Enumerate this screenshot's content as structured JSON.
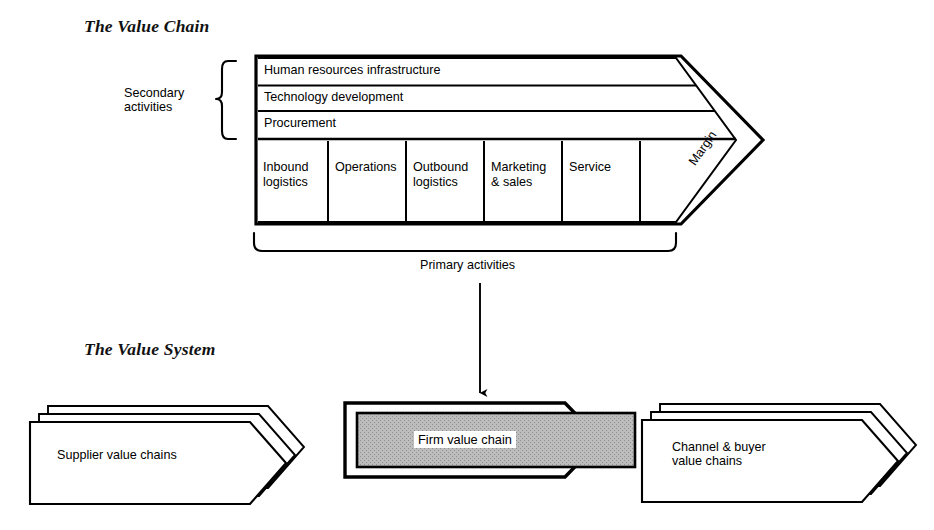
{
  "page": {
    "background_color": "#ffffff",
    "ink_color": "#000000",
    "gray_fill": "#b5b5b5"
  },
  "sections": {
    "value_chain": {
      "title": "The Value Chain",
      "secondary_activities_label": "Secondary\nactivities",
      "primary_activities_label": "Primary activities",
      "margin_label": "Margin",
      "support_rows": [
        {
          "id": "human-resources",
          "label": "Human resources infrastructure"
        },
        {
          "id": "technology-development",
          "label": "Technology development"
        },
        {
          "id": "procurement",
          "label": "Procurement"
        }
      ],
      "primary_activities": [
        {
          "id": "inbound-logistics",
          "label": "Inbound\nlogistics"
        },
        {
          "id": "operations",
          "label": "Operations"
        },
        {
          "id": "outbound-logistics",
          "label": "Outbound\nlogistics"
        },
        {
          "id": "marketing-sales",
          "label": "Marketing\n& sales"
        },
        {
          "id": "service",
          "label": "Service"
        }
      ]
    },
    "value_system": {
      "title": "The Value System",
      "nodes": [
        {
          "id": "supplier-value-chains",
          "label": "Supplier value chains",
          "stacked": true,
          "highlighted": false
        },
        {
          "id": "firm-value-chain",
          "label": "Firm value chain",
          "stacked": false,
          "highlighted": true
        },
        {
          "id": "channel-buyer-value-chains",
          "label": "Channel & buyer\nvalue chains",
          "stacked": true,
          "highlighted": false
        }
      ]
    }
  },
  "connector": {
    "id": "primary-to-firm-arrow",
    "from": "primary-activities-label",
    "to": "firm-value-chain"
  }
}
